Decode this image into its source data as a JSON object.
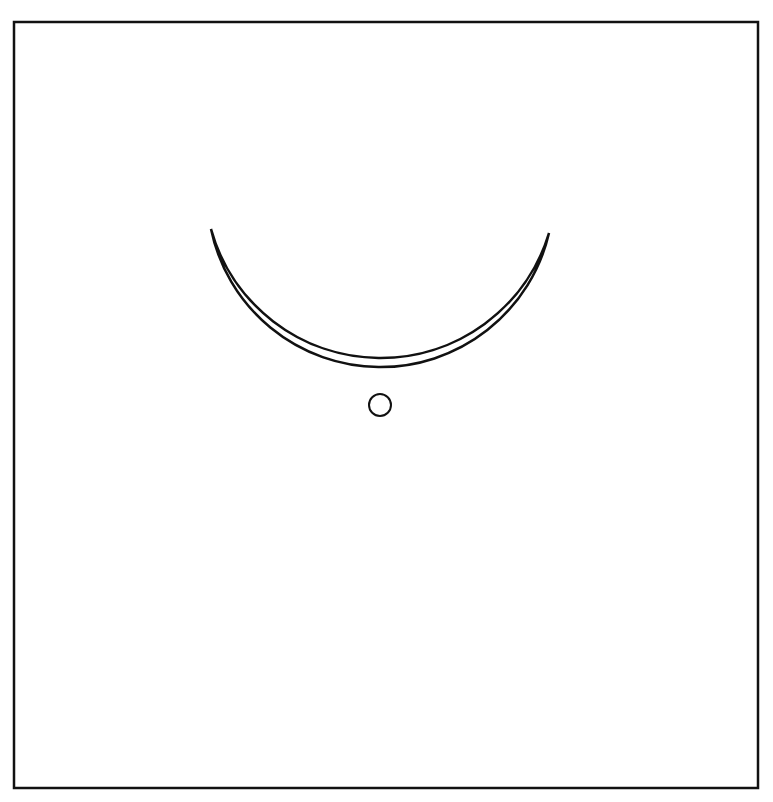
{
  "canvas": {
    "width": 773,
    "height": 802,
    "background": "#ffffff"
  },
  "border": {
    "x": 14,
    "y": 22,
    "width": 744,
    "height": 766,
    "stroke": "#111111",
    "stroke_width": 2.5
  },
  "crescent": {
    "stroke": "#111111",
    "stroke_width": 2.5,
    "fill": "none",
    "left_tip": [
      211,
      229
    ],
    "right_tip": [
      549,
      233
    ],
    "outer_arc": {
      "cx": 380,
      "cy": 278,
      "r": 176
    },
    "inner_arc": {
      "cx": 380,
      "cy": 191,
      "r": 173
    }
  },
  "dot": {
    "cx": 380,
    "cy": 405,
    "r": 11,
    "stroke": "#111111",
    "stroke_width": 2
  }
}
